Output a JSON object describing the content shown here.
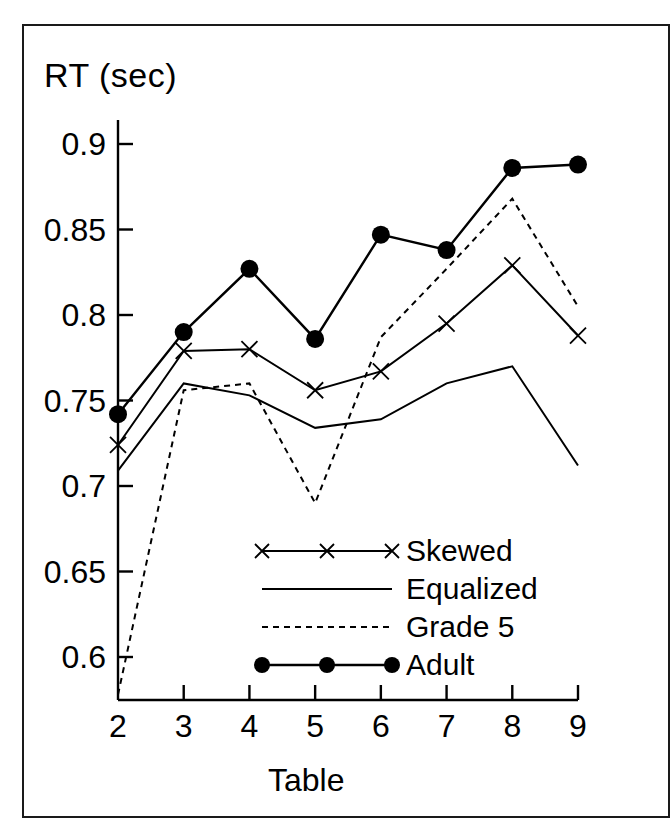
{
  "axes": {
    "y_title": "RT (sec)",
    "x_title": "Table",
    "y_ticks": [
      "0.9",
      "0.85",
      "0.8",
      "0.75",
      "0.7",
      "0.65",
      "0.6"
    ],
    "x_ticks": [
      "2",
      "3",
      "4",
      "5",
      "6",
      "7",
      "8",
      "9"
    ]
  },
  "legend": {
    "entries": [
      {
        "label": "Skewed",
        "marker": "x-marker",
        "style": "solid"
      },
      {
        "label": "Equalized",
        "marker": "none",
        "style": "solid"
      },
      {
        "label": "Grade 5",
        "marker": "none",
        "style": "dashed"
      },
      {
        "label": "Adult",
        "marker": "dot-marker",
        "style": "solid"
      }
    ]
  },
  "colors": {
    "ink": "#000000",
    "frame": "#1a1a1a",
    "background": "#ffffff"
  },
  "chart_data": {
    "type": "line",
    "title": "",
    "xlabel": "Table",
    "ylabel": "RT (sec)",
    "x": [
      2,
      3,
      4,
      5,
      6,
      7,
      8,
      9
    ],
    "xlim": [
      1.72,
      9.0
    ],
    "ylim": [
      0.568,
      0.918
    ],
    "grid": false,
    "legend_position": "inside-lower-right",
    "series": [
      {
        "name": "Skewed",
        "marker": "x",
        "linestyle": "solid",
        "values": [
          0.724,
          0.779,
          0.78,
          0.756,
          0.767,
          0.795,
          0.829,
          0.788
        ]
      },
      {
        "name": "Equalized",
        "marker": "none",
        "linestyle": "solid",
        "values": [
          0.709,
          0.76,
          0.753,
          0.734,
          0.739,
          0.76,
          0.77,
          0.712
        ]
      },
      {
        "name": "Grade 5",
        "marker": "none",
        "linestyle": "dashed",
        "values": [
          0.578,
          0.756,
          0.76,
          0.69,
          0.787,
          0.827,
          0.868,
          0.805
        ]
      },
      {
        "name": "Adult",
        "marker": "dot",
        "linestyle": "solid",
        "values": [
          0.742,
          0.79,
          0.827,
          0.786,
          0.847,
          0.838,
          0.886,
          0.888
        ]
      }
    ]
  }
}
